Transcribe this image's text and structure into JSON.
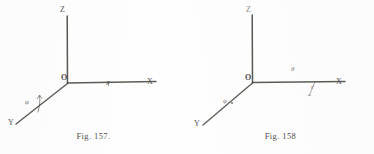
{
  "page": {
    "background_color": "#fefefe",
    "ink_color": "#41413f"
  },
  "figures": [
    {
      "id": "fig-157",
      "caption": "Fig. 157.",
      "origin_label": "O",
      "axes": [
        {
          "name": "z-axis",
          "label": "Z"
        },
        {
          "name": "x-axis",
          "label": "X"
        },
        {
          "name": "y-axis",
          "label": "Y"
        }
      ],
      "annotations": [
        {
          "name": "azimuth-angle",
          "label": "φ"
        },
        {
          "name": "point-p",
          "label": "P"
        }
      ]
    },
    {
      "id": "fig-158",
      "caption": "Fig. 158",
      "origin_label": "O",
      "axes": [
        {
          "name": "z-axis",
          "label": "Z"
        },
        {
          "name": "x-axis",
          "label": "X"
        },
        {
          "name": "y-axis",
          "label": "Y"
        }
      ],
      "annotations": [
        {
          "name": "polar-angle",
          "label": "θ"
        },
        {
          "name": "azimuth-angle",
          "label": "φ"
        },
        {
          "name": "radius-marker",
          "label": "r"
        },
        {
          "name": "point-p",
          "label": "P"
        }
      ]
    }
  ]
}
